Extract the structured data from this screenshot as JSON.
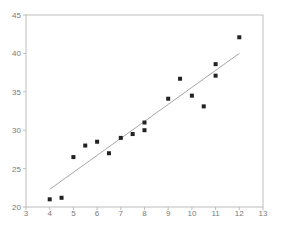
{
  "chart_data": {
    "type": "scatter",
    "title": "",
    "xlabel": "",
    "ylabel": "",
    "xlim": [
      3,
      13
    ],
    "ylim": [
      20,
      45
    ],
    "x_ticks": [
      "3",
      "4",
      "5",
      "6",
      "7",
      "8",
      "9",
      "10",
      "11",
      "12",
      "13"
    ],
    "y_ticks": [
      "20",
      "25",
      "30",
      "35",
      "40",
      "45"
    ],
    "grid": false,
    "legend": null,
    "series": [
      {
        "name": "observations",
        "type": "scatter",
        "marker": "square",
        "color": "#222222",
        "points": [
          [
            4.0,
            21.0
          ],
          [
            4.5,
            21.2
          ],
          [
            5.0,
            26.5
          ],
          [
            5.5,
            28.0
          ],
          [
            6.0,
            28.5
          ],
          [
            6.5,
            27.0
          ],
          [
            7.0,
            29.0
          ],
          [
            7.5,
            29.5
          ],
          [
            8.0,
            31.0
          ],
          [
            8.0,
            30.0
          ],
          [
            9.0,
            34.1
          ],
          [
            9.5,
            36.7
          ],
          [
            10.0,
            34.5
          ],
          [
            10.5,
            33.1
          ],
          [
            11.0,
            38.6
          ],
          [
            11.0,
            37.1
          ],
          [
            12.0,
            42.1
          ]
        ]
      },
      {
        "name": "fitted line",
        "type": "line",
        "color": "#a8a8a8",
        "points": [
          [
            4.0,
            22.3
          ],
          [
            12.0,
            40.0
          ]
        ]
      }
    ]
  }
}
